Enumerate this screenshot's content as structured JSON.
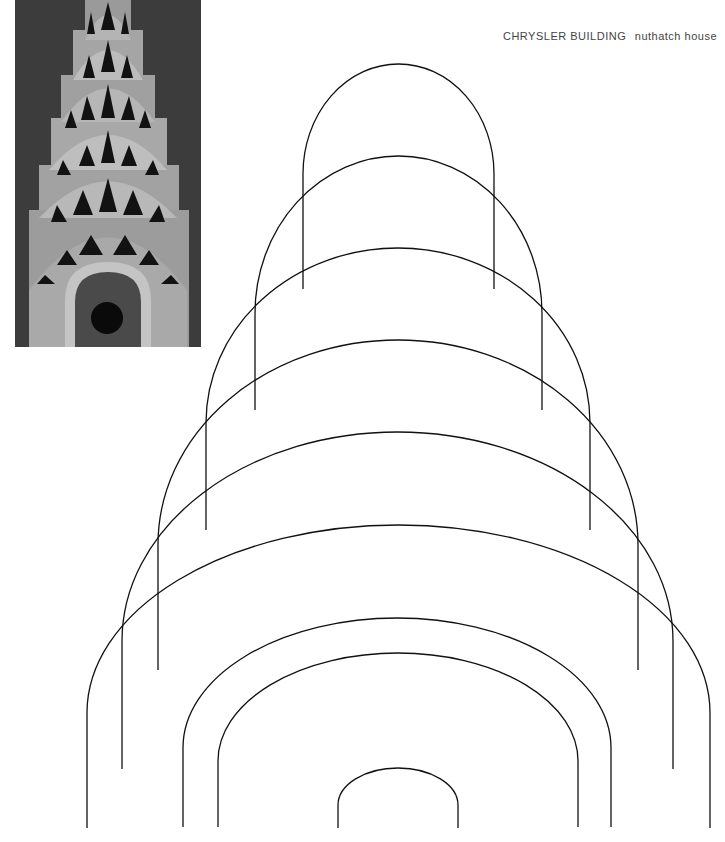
{
  "caption": {
    "title": "CHRYSLER BUILDING",
    "subtitle": "nuthatch house"
  },
  "photo": {
    "subject": "Chrysler Building spire crown with stacked sunburst arches and triangular windows",
    "colors": {
      "background": "#3a3a3a",
      "metal": "#b8b8b8",
      "window": "#111111"
    }
  },
  "drawing": {
    "stroke_color": "#111111",
    "arches": [
      {
        "top": 64,
        "left": 303,
        "right": 494,
        "bottom": 289
      },
      {
        "top": 156,
        "left": 255,
        "right": 542,
        "bottom": 410
      },
      {
        "top": 248,
        "left": 206,
        "right": 590,
        "bottom": 530
      },
      {
        "top": 340,
        "left": 158,
        "right": 638,
        "bottom": 670
      },
      {
        "top": 432,
        "left": 122,
        "right": 673,
        "bottom": 769
      },
      {
        "top": 525,
        "left": 87,
        "right": 710,
        "bottom": 828
      },
      {
        "top": 618,
        "left": 183,
        "right": 611,
        "bottom": 827
      },
      {
        "top": 653,
        "left": 218,
        "right": 578,
        "bottom": 827
      },
      {
        "top": 768,
        "left": 338,
        "right": 458,
        "bottom": 828
      }
    ]
  }
}
